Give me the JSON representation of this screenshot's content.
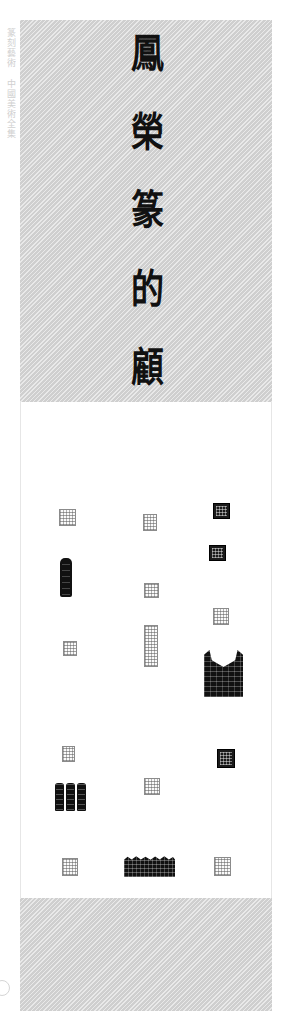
{
  "page": {
    "background_color": "#ffffff",
    "plate_gray": "#cfcfcf",
    "ink_color": "#111111"
  },
  "margin_note": {
    "text": "篆刻藝術  中國美術全集",
    "color": "#c9c9c9"
  },
  "title_column": {
    "script": "seal-script",
    "reading_direction": "top-to-bottom",
    "characters": [
      {
        "glyph": "鳳",
        "index": 1
      },
      {
        "glyph": "榮",
        "index": 2
      },
      {
        "glyph": "篆",
        "index": 3
      },
      {
        "glyph": "的",
        "index": 4
      },
      {
        "glyph": "顧",
        "index": 5
      }
    ]
  },
  "seal_plate": {
    "columns": 3,
    "seals": [
      {
        "id": "seal-1",
        "style": "outline",
        "x": 59,
        "y": 509,
        "w": 15,
        "h": 15
      },
      {
        "id": "seal-2",
        "style": "outline",
        "x": 143,
        "y": 514,
        "w": 12,
        "h": 15
      },
      {
        "id": "seal-3",
        "style": "dark",
        "x": 213,
        "y": 503,
        "w": 15,
        "h": 14
      },
      {
        "id": "seal-4",
        "style": "dark",
        "x": 209,
        "y": 545,
        "w": 15,
        "h": 14
      },
      {
        "id": "seal-5",
        "style": "shield",
        "x": 226,
        "y": 544,
        "w": 14,
        "h": 16
      },
      {
        "id": "seal-6",
        "style": "bar",
        "x": 60,
        "y": 558,
        "w": 12,
        "h": 39
      },
      {
        "id": "seal-7",
        "style": "outline",
        "x": 144,
        "y": 583,
        "w": 13,
        "h": 13
      },
      {
        "id": "seal-8",
        "style": "outline",
        "x": 213,
        "y": 608,
        "w": 14,
        "h": 15
      },
      {
        "id": "seal-9",
        "style": "outline",
        "x": 63,
        "y": 641,
        "w": 12,
        "h": 13
      },
      {
        "id": "seal-10",
        "style": "outline",
        "x": 144,
        "y": 625,
        "w": 12,
        "h": 40
      },
      {
        "id": "seal-11",
        "style": "notch",
        "x": 204,
        "y": 650,
        "w": 39,
        "h": 47
      },
      {
        "id": "seal-12",
        "style": "round",
        "x": 140,
        "y": 713,
        "w": 15,
        "h": 15
      },
      {
        "id": "seal-13",
        "style": "outline",
        "x": 62,
        "y": 746,
        "w": 11,
        "h": 14
      },
      {
        "id": "seal-14",
        "style": "dark",
        "x": 217,
        "y": 749,
        "w": 16,
        "h": 17
      },
      {
        "id": "seal-15",
        "style": "triple",
        "x": 55,
        "y": 783,
        "w": 31,
        "h": 28
      },
      {
        "id": "seal-16",
        "style": "outline",
        "x": 144,
        "y": 778,
        "w": 14,
        "h": 15
      },
      {
        "id": "seal-17",
        "style": "shield",
        "x": 219,
        "y": 790,
        "w": 15,
        "h": 17
      },
      {
        "id": "seal-18",
        "style": "shield",
        "x": 143,
        "y": 815,
        "w": 15,
        "h": 15
      },
      {
        "id": "seal-19",
        "style": "outline",
        "x": 62,
        "y": 858,
        "w": 14,
        "h": 16
      },
      {
        "id": "seal-20",
        "style": "wave",
        "x": 124,
        "y": 855,
        "w": 51,
        "h": 22
      },
      {
        "id": "seal-21",
        "style": "outline",
        "x": 214,
        "y": 857,
        "w": 15,
        "h": 17
      }
    ]
  }
}
